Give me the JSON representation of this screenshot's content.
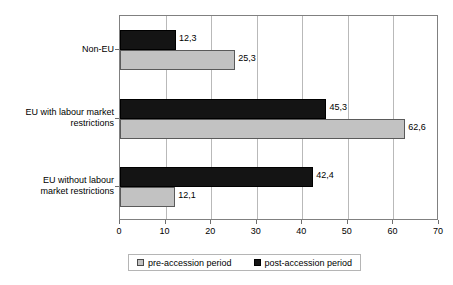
{
  "chart_data": {
    "type": "bar",
    "orientation": "horizontal",
    "title": "",
    "subtitle": "",
    "xlabel": "",
    "ylabel": "",
    "xlim": [
      0,
      70
    ],
    "xticks": [
      "0",
      "10",
      "20",
      "30",
      "40",
      "50",
      "60",
      "70"
    ],
    "grid": true,
    "legend_position": "bottom",
    "categories": [
      "Non-EU",
      "EU with labour market restrictions",
      "EU without labour market restrictions"
    ],
    "category_lines": [
      [
        "Non-EU"
      ],
      [
        "EU with labour market",
        "restrictions"
      ],
      [
        "EU without labour",
        "market restrictions"
      ]
    ],
    "series": [
      {
        "name": "pre-accession period",
        "color": "#c2c2c2",
        "values": [
          25.3,
          62.6,
          12.1
        ],
        "labels": [
          "25,3",
          "62,6",
          "12,1"
        ]
      },
      {
        "name": "post-accession period",
        "color": "#141414",
        "values": [
          12.3,
          45.3,
          42.4
        ],
        "labels": [
          "12,3",
          "45,3",
          "42,4"
        ]
      }
    ]
  },
  "legend": {
    "items": [
      {
        "label": "pre-accession period",
        "swatch": "pre"
      },
      {
        "label": "post-accession period",
        "swatch": "post"
      }
    ]
  },
  "axis": {
    "x_tick_labels": [
      "0",
      "10",
      "20",
      "30",
      "40",
      "50",
      "60",
      "70"
    ]
  }
}
